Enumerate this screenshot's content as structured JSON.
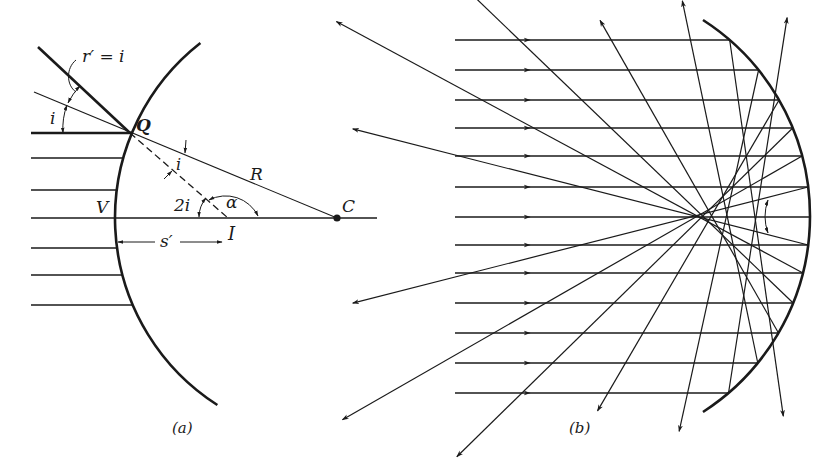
{
  "figure": {
    "panel_a": {
      "caption": "(a)",
      "labels": {
        "r_prime": "r′ = i",
        "i_incident": "i",
        "Q": "Q",
        "i_inner": "i",
        "R": "R",
        "two_i": "2i",
        "alpha": "α",
        "V": "V",
        "C": "C",
        "I": "I",
        "s_prime": "s′"
      },
      "mirror": {
        "center": [
          337,
          218
        ],
        "radius": 222,
        "y_top": 43,
        "y_bottom": 405
      },
      "axis": {
        "x_start": 31,
        "x_end": 377,
        "y": 218
      },
      "incoming_rays_y": [
        133,
        158,
        190,
        218,
        248,
        275,
        305
      ],
      "rays_x_start": 31,
      "marked_ray_y": 133
    },
    "panel_b": {
      "caption": "(b)",
      "mirror": {
        "center": [
          577,
          216
        ],
        "radius": 233,
        "y_top": 20,
        "y_bottom": 412
      },
      "incoming_rays_y": [
        40,
        70,
        100,
        128,
        156,
        187,
        217,
        245,
        273,
        303,
        333,
        363,
        393
      ],
      "rays_x_start": 455,
      "arrow_x": 530,
      "reflected_lengths": [
        380,
        370,
        360,
        470,
        530,
        470,
        0,
        470,
        530,
        470,
        360,
        370,
        380
      ],
      "caustic_marker": {
        "x": 768,
        "y_top": 200,
        "y_bottom": 233
      }
    },
    "colors": {
      "ink": "#1a1a1a",
      "paper": "#ffffff"
    }
  }
}
